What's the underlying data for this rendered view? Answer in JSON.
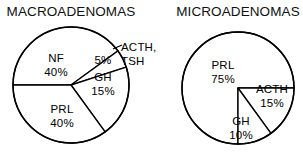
{
  "figure": {
    "background": "#ffffff",
    "stroke_color": "#000000",
    "slice_fill": "#ffffff"
  },
  "chart_data": [
    {
      "type": "pie",
      "title": "MACROADENOMAS",
      "xlabel": "",
      "ylabel": "",
      "legend": "none",
      "grid": false,
      "categories": [
        "NF",
        "ACTH, TSH",
        "GH",
        "PRL"
      ],
      "values": [
        40,
        5,
        15,
        40
      ],
      "unit": "%",
      "slices": [
        {
          "name": "NF",
          "label": "NF",
          "value": 40,
          "value_label": "40%",
          "start_deg": 180,
          "end_deg": 324,
          "label_x": 56,
          "label_y": 62,
          "label2_x": 56,
          "label2_y": 76
        },
        {
          "name": "ACTH-TSH",
          "label": "ACTH,",
          "label_line2": "TSH",
          "value": 5,
          "value_label": "5%",
          "start_deg": 324,
          "end_deg": 342,
          "label_x": 119,
          "label_y": 52,
          "label2_x": 119,
          "label2_y": 66,
          "inner_label_x": 104,
          "inner_label_y": 62
        },
        {
          "name": "GH",
          "label": "GH",
          "value": 15,
          "value_label": "15%",
          "start_deg": 342,
          "end_deg": 54,
          "label_x": 102,
          "label_y": 80,
          "label2_x": 102,
          "label2_y": 94
        },
        {
          "name": "PRL",
          "label": "PRL",
          "value": 40,
          "value_label": "40%",
          "start_deg": 54,
          "end_deg": 180,
          "label_x": 62,
          "label_y": 112,
          "label2_x": 62,
          "label2_y": 126
        }
      ],
      "geometry": {
        "cx": 71,
        "cy": 85,
        "r": 58,
        "title_x": 71,
        "title_y": 16
      }
    },
    {
      "type": "pie",
      "title": "MICROADENOMAS",
      "xlabel": "",
      "ylabel": "",
      "legend": "none",
      "grid": false,
      "categories": [
        "PRL",
        "ACTH",
        "GH"
      ],
      "values": [
        75,
        15,
        10
      ],
      "unit": "%",
      "slices": [
        {
          "name": "PRL",
          "label": "PRL",
          "value": 75,
          "value_label": "75%",
          "start_deg": 90,
          "end_deg": 0,
          "label_x": 224,
          "label_y": 68,
          "label2_x": 224,
          "label2_y": 82
        },
        {
          "name": "ACTH",
          "label": "ACTH",
          "value": 15,
          "value_label": "15%",
          "start_deg": 0,
          "end_deg": 54,
          "label_x": 272,
          "label_y": 92,
          "label2_x": 272,
          "label2_y": 106
        },
        {
          "name": "GH",
          "label": "GH",
          "value": 10,
          "value_label": "10%",
          "start_deg": 54,
          "end_deg": 90,
          "label_x": 240,
          "label_y": 124,
          "label2_x": 240,
          "label2_y": 138
        }
      ],
      "geometry": {
        "cx": 238,
        "cy": 88,
        "r": 56,
        "title_x": 238,
        "title_y": 16
      }
    }
  ]
}
